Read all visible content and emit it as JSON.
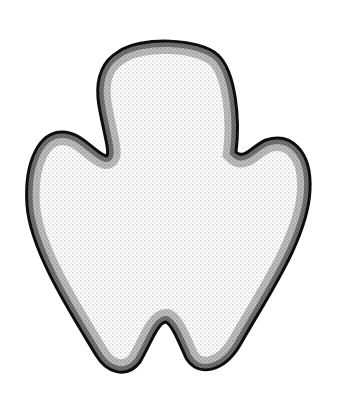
{
  "illustration": {
    "subject": "stippled three-lobed blob shape",
    "style": "stipple shading, dark edges fading to white center",
    "background": "#ffffff",
    "ink": "#111111",
    "outline_path": "M 118 52 C 140 36, 200 38, 218 55 C 236 72, 240 120, 236 152 C 244 160, 252 146, 266 140 C 290 132, 312 150, 310 190 C 308 240, 265 300, 240 345 C 224 372, 198 378, 186 358 C 178 340, 172 325, 166 322 C 158 322, 150 345, 140 362 C 126 380, 106 372, 96 355 C 70 312, 30 250, 27 205 C 24 160, 40 132, 62 132 C 82 132, 94 152, 106 156 C 112 156, 100 120, 98 98 C 96 76, 104 60, 118 52 Z"
  }
}
